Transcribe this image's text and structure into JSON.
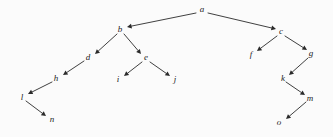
{
  "figure": {
    "type": "tree-diagram",
    "background_color": "#fbfbfb",
    "edge_color": "#2a2a2a",
    "label_color": "#1c1c1c",
    "root": "a"
  },
  "nodes": [
    {
      "id": "a",
      "label": "a",
      "x": 202,
      "y": 9
    },
    {
      "id": "b",
      "label": "b",
      "x": 120,
      "y": 29
    },
    {
      "id": "c",
      "label": "c",
      "x": 281,
      "y": 31
    },
    {
      "id": "d",
      "label": "d",
      "x": 88,
      "y": 57
    },
    {
      "id": "e",
      "label": "e",
      "x": 146,
      "y": 57
    },
    {
      "id": "f",
      "label": "f",
      "x": 251,
      "y": 54
    },
    {
      "id": "g",
      "label": "g",
      "x": 311,
      "y": 53
    },
    {
      "id": "h",
      "label": "h",
      "x": 56,
      "y": 78
    },
    {
      "id": "i",
      "label": "i",
      "x": 118,
      "y": 79
    },
    {
      "id": "j",
      "label": "j",
      "x": 175,
      "y": 79
    },
    {
      "id": "k",
      "label": "k",
      "x": 283,
      "y": 78
    },
    {
      "id": "l",
      "label": "l",
      "x": 22,
      "y": 97
    },
    {
      "id": "m",
      "label": "m",
      "x": 310,
      "y": 98
    },
    {
      "id": "n",
      "label": "n",
      "x": 52,
      "y": 119
    },
    {
      "id": "o",
      "label": "o",
      "x": 279,
      "y": 122
    }
  ],
  "edges": [
    {
      "from": "a",
      "to": "b",
      "x1": 196,
      "y1": 13,
      "x2": 127,
      "y2": 27
    },
    {
      "from": "a",
      "to": "c",
      "x1": 208,
      "y1": 13,
      "x2": 276,
      "y2": 29
    },
    {
      "from": "b",
      "to": "d",
      "x1": 117,
      "y1": 34,
      "x2": 95,
      "y2": 54
    },
    {
      "from": "b",
      "to": "e",
      "x1": 124,
      "y1": 34,
      "x2": 141,
      "y2": 54
    },
    {
      "from": "c",
      "to": "f",
      "x1": 277,
      "y1": 36,
      "x2": 257,
      "y2": 51
    },
    {
      "from": "c",
      "to": "g",
      "x1": 285,
      "y1": 36,
      "x2": 307,
      "y2": 50
    },
    {
      "from": "d",
      "to": "h",
      "x1": 84,
      "y1": 61,
      "x2": 63,
      "y2": 75
    },
    {
      "from": "e",
      "to": "i",
      "x1": 142,
      "y1": 62,
      "x2": 124,
      "y2": 76
    },
    {
      "from": "e",
      "to": "j",
      "x1": 150,
      "y1": 62,
      "x2": 170,
      "y2": 76
    },
    {
      "from": "g",
      "to": "k",
      "x1": 308,
      "y1": 58,
      "x2": 289,
      "y2": 75
    },
    {
      "from": "h",
      "to": "l",
      "x1": 52,
      "y1": 82,
      "x2": 28,
      "y2": 94
    },
    {
      "from": "k",
      "to": "m",
      "x1": 286,
      "y1": 82,
      "x2": 305,
      "y2": 95
    },
    {
      "from": "l",
      "to": "n",
      "x1": 26,
      "y1": 101,
      "x2": 46,
      "y2": 116
    },
    {
      "from": "m",
      "to": "o",
      "x1": 306,
      "y1": 102,
      "x2": 286,
      "y2": 119
    }
  ]
}
